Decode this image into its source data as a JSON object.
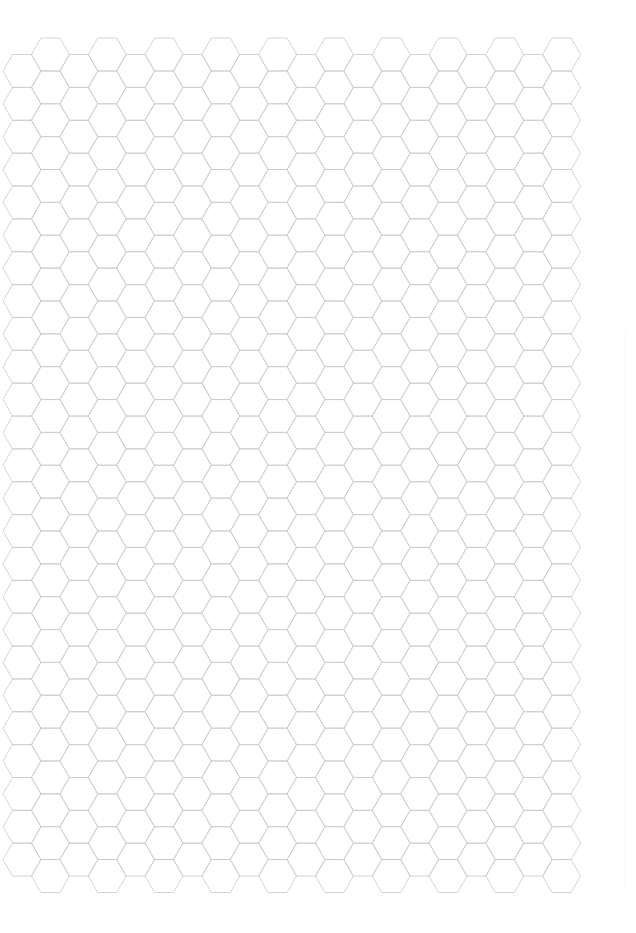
{
  "document": {
    "type": "hexagonal graph paper",
    "page_width": 636,
    "page_height": 933,
    "header_watermark": ""
  },
  "grid": {
    "orientation": "flat-top",
    "columns": 20,
    "first_column_center_x": 22,
    "column_step_x": 28.4,
    "side_length": 19,
    "row_step_y": 32.86,
    "even_column_first_center_y": 71,
    "even_column_rows": 25,
    "odd_column_first_center_y": 54.5,
    "odd_column_rows": 26,
    "line_color": "#c9c9c9",
    "line_width": 0.8,
    "background_color": "#ffffff"
  }
}
